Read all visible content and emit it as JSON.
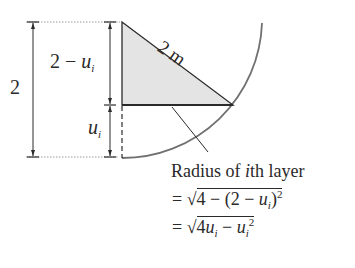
{
  "diagram": {
    "total_height_label": "2",
    "upper_segment_label": {
      "main": "2 − ",
      "var": "u",
      "sub": "i"
    },
    "lower_segment_label": {
      "var": "u",
      "sub": "i"
    },
    "hypotenuse_label": "2 m",
    "caption": {
      "title_pre": "Radius of ",
      "title_it": "i",
      "title_post": "th layer",
      "line1": {
        "eq": "=",
        "radical": "√",
        "body_pre": "4 − (2 − ",
        "var": "u",
        "sub": "i",
        "body_post": ")",
        "exp": "2"
      },
      "line2": {
        "eq": "=",
        "radical": "√",
        "body_pre": "4",
        "var1": "u",
        "sub1": "i",
        "minus": " − ",
        "var2": "u",
        "sub2": "i",
        "exp": "2"
      }
    },
    "colors": {
      "stroke": "#2a2a2a",
      "arc": "#707070",
      "shade": "#e4e4e4",
      "dotted": "#9a9a9a"
    }
  }
}
